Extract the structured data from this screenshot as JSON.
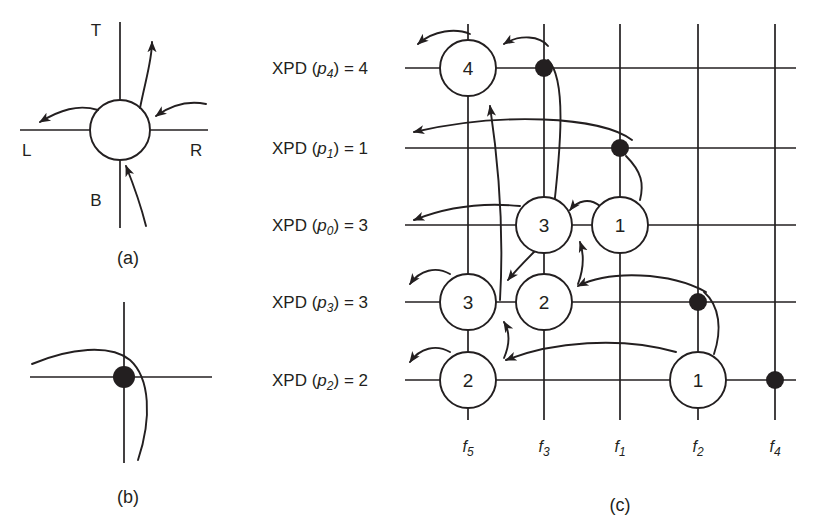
{
  "figure": {
    "panels": [
      {
        "id": "a",
        "caption": "(a)",
        "caption_x": 128,
        "caption_y": 258
      },
      {
        "id": "b",
        "caption": "(b)",
        "caption_x": 128,
        "caption_y": 497
      },
      {
        "id": "c",
        "caption": "(c)",
        "caption_x": 620,
        "caption_y": 505
      }
    ]
  },
  "panel_a": {
    "direction_labels": [
      {
        "name": "top",
        "text": "T",
        "x": 96,
        "y": 36
      },
      {
        "name": "left",
        "text": "L",
        "x": 22,
        "y": 156
      },
      {
        "name": "right",
        "text": "R",
        "x": 196,
        "y": 156
      },
      {
        "name": "bottom",
        "text": "B",
        "x": 96,
        "y": 206
      }
    ]
  },
  "panel_c": {
    "row_labels": [
      {
        "key": "p4",
        "prefix": "XPD (",
        "var": "p",
        "sub": "4",
        "suffix": ") = 4",
        "value": 4,
        "y": 68
      },
      {
        "key": "p1",
        "prefix": "XPD (",
        "var": "p",
        "sub": "1",
        "suffix": ") = 1",
        "value": 1,
        "y": 148
      },
      {
        "key": "p0",
        "prefix": "XPD (",
        "var": "p",
        "sub": "0",
        "suffix": ") = 3",
        "value": 3,
        "y": 225
      },
      {
        "key": "p3",
        "prefix": "XPD (",
        "var": "p",
        "sub": "3",
        "suffix": ") = 3",
        "value": 3,
        "y": 302
      },
      {
        "key": "p2",
        "prefix": "XPD (",
        "var": "p",
        "sub": "2",
        "suffix": ") = 2",
        "value": 2,
        "y": 380
      }
    ],
    "column_labels": [
      {
        "key": "f5",
        "var": "f",
        "sub": "5",
        "x": 468,
        "y": 450
      },
      {
        "key": "f3",
        "var": "f",
        "sub": "3",
        "x": 544,
        "y": 450
      },
      {
        "key": "f1",
        "var": "f",
        "sub": "1",
        "x": 620,
        "y": 450
      },
      {
        "key": "f2",
        "var": "f",
        "sub": "2",
        "x": 698,
        "y": 450
      },
      {
        "key": "f4",
        "var": "f",
        "sub": "4",
        "x": 775,
        "y": 450
      }
    ],
    "nodes": [
      {
        "label": "4",
        "col": "f5",
        "row": "p4",
        "cx": 468,
        "cy": 68,
        "r": 28
      },
      {
        "label": "3",
        "col": "f3",
        "row": "p0",
        "cx": 544,
        "cy": 225,
        "r": 28
      },
      {
        "label": "1",
        "col": "f1",
        "row": "p0",
        "cx": 620,
        "cy": 225,
        "r": 28
      },
      {
        "label": "3",
        "col": "f5",
        "row": "p3",
        "cx": 468,
        "cy": 302,
        "r": 28
      },
      {
        "label": "2",
        "col": "f3",
        "row": "p3",
        "cx": 544,
        "cy": 302,
        "r": 28
      },
      {
        "label": "2",
        "col": "f5",
        "row": "p2",
        "cx": 468,
        "cy": 380,
        "r": 28
      },
      {
        "label": "1",
        "col": "f2",
        "row": "p2",
        "cx": 698,
        "cy": 380,
        "r": 28
      }
    ],
    "dots": [
      {
        "col": "f3",
        "row": "p4",
        "cx": 544,
        "cy": 68,
        "r": 9
      },
      {
        "col": "f1",
        "row": "p1",
        "cx": 620,
        "cy": 148,
        "r": 9
      },
      {
        "col": "f2",
        "row": "p3",
        "cx": 698,
        "cy": 302,
        "r": 9
      },
      {
        "col": "f4",
        "row": "p2",
        "cx": 775,
        "cy": 380,
        "r": 9
      }
    ]
  },
  "colors": {
    "ink": "#231f20",
    "paper": "#ffffff"
  }
}
